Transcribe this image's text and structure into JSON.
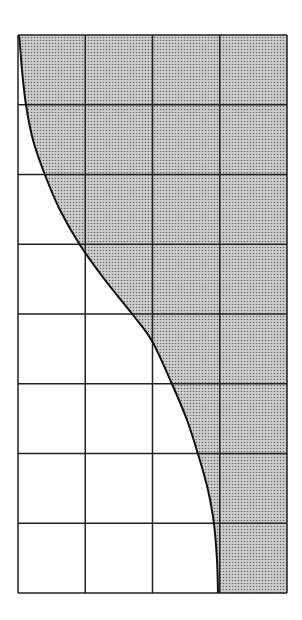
{
  "diagram": {
    "type": "shaded-grid-curve",
    "grid": {
      "columns": 4,
      "rows": 8,
      "left": 18,
      "top": 35,
      "right": 287,
      "bottom": 593,
      "line_color": "#222222"
    },
    "shading": {
      "fill_color": "#c9c9c9",
      "dot_color": "#6a6a6a",
      "region": "right-of-curve"
    },
    "curve": {
      "stroke_color": "#111111",
      "points": [
        [
          19,
          35
        ],
        [
          20,
          45
        ],
        [
          22,
          70
        ],
        [
          26,
          105
        ],
        [
          33,
          140
        ],
        [
          45,
          175
        ],
        [
          60,
          210
        ],
        [
          80,
          245
        ],
        [
          105,
          280
        ],
        [
          133,
          315
        ],
        [
          152,
          341
        ],
        [
          172,
          384
        ],
        [
          187,
          420
        ],
        [
          198,
          454
        ],
        [
          208,
          490
        ],
        [
          214,
          524
        ],
        [
          217,
          560
        ],
        [
          218,
          593
        ]
      ]
    }
  }
}
